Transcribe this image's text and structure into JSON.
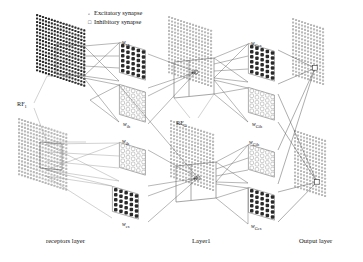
{
  "figure": {
    "type": "neural-network-architecture-diagram",
    "background": "#ffffff",
    "width": 363,
    "height": 262
  },
  "legend": {
    "items": [
      {
        "marker": "circle-open-icon",
        "glyph": "°",
        "label": "Excitatory synapse"
      },
      {
        "marker": "square-open-icon",
        "glyph": "¤",
        "label": "Inhibitory synapse"
      }
    ]
  },
  "layers": [
    {
      "id": "receptors",
      "caption": "receptors layer",
      "x": 46,
      "y": 238
    },
    {
      "id": "layer1",
      "caption": "Layer1",
      "x": 192,
      "y": 238
    },
    {
      "id": "output",
      "caption": "Output layer",
      "x": 299,
      "y": 238
    }
  ],
  "receptive_fields": [
    {
      "id": "rf1",
      "label": "RF",
      "sub": "1",
      "x": 17,
      "y": 101
    },
    {
      "id": "rfg",
      "label": "RF",
      "sub": "G",
      "x": 176,
      "y": 120
    }
  ],
  "weights": [
    {
      "id": "w-ex-top",
      "label": "w",
      "sub": "ex",
      "x": 122,
      "y": 40,
      "kind": "excitatory"
    },
    {
      "id": "w-ih-top",
      "label": "w",
      "sub": "ih",
      "x": 123,
      "y": 122,
      "kind": "inhibitory"
    },
    {
      "id": "w-ih-bot",
      "label": "w",
      "sub": "ih",
      "x": 122,
      "y": 139,
      "kind": "inhibitory"
    },
    {
      "id": "w-ex-bot",
      "label": "w",
      "sub": "ex",
      "x": 122,
      "y": 222,
      "kind": "excitatory"
    },
    {
      "id": "w-gex-top",
      "label": "w",
      "sub": "Gex",
      "x": 251,
      "y": 41,
      "kind": "excitatory"
    },
    {
      "id": "w-gih-top",
      "label": "w",
      "sub": "Gih",
      "x": 252,
      "y": 122,
      "kind": "inhibitory"
    },
    {
      "id": "w-gih-bot",
      "label": "w",
      "sub": "Gih",
      "x": 249,
      "y": 140,
      "kind": "inhibitory"
    },
    {
      "id": "w-gex-bot",
      "label": "w",
      "sub": "Gex",
      "x": 251,
      "y": 224,
      "kind": "excitatory"
    }
  ],
  "colors": {
    "dark_cell": "#2b2b2b",
    "light_cell": "#b9b9b9",
    "mid_cell": "#8c8c8c",
    "line": "#7a7a7a",
    "line_dark": "#4a4a4a",
    "text": "#111111",
    "white": "#ffffff"
  },
  "planes": {
    "receptor_top": {
      "cols": 17,
      "rows": 17,
      "shade": "dark"
    },
    "receptor_bottom": {
      "cols": 17,
      "rows": 17,
      "shade": "light"
    },
    "layer1_top": {
      "cols": 15,
      "rows": 17,
      "shade": "light"
    },
    "layer1_bottom": {
      "cols": 15,
      "rows": 17,
      "shade": "light"
    },
    "output": {
      "cols": 11,
      "rows": 17,
      "shade": "light"
    }
  },
  "weight_panels": [
    {
      "id": "w-ex-top-panel",
      "cols": 5,
      "rows": 6,
      "shade": "dark"
    },
    {
      "id": "w-ih-top-panel",
      "cols": 5,
      "rows": 6,
      "shade": "white"
    },
    {
      "id": "w-ih-bot-panel",
      "cols": 5,
      "rows": 5,
      "shade": "white"
    },
    {
      "id": "w-ex-bot-panel",
      "cols": 5,
      "rows": 5,
      "shade": "dark"
    },
    {
      "id": "w-gex-top-panel",
      "cols": 5,
      "rows": 6,
      "shade": "dark"
    },
    {
      "id": "w-gih-top-panel",
      "cols": 5,
      "rows": 5,
      "shade": "white"
    },
    {
      "id": "w-gih-bot-panel",
      "cols": 5,
      "rows": 5,
      "shade": "white"
    },
    {
      "id": "w-gex-bot-panel",
      "cols": 5,
      "rows": 5,
      "shade": "dark"
    }
  ],
  "nodes": [
    {
      "id": "layer1-neuron-top",
      "marker": "circle-icon",
      "x": 196,
      "y": 72
    },
    {
      "id": "layer1-neuron-bot",
      "marker": "circle-icon",
      "x": 198,
      "y": 178
    },
    {
      "id": "output-neuron-top",
      "marker": "square-icon",
      "x": 315,
      "y": 68
    },
    {
      "id": "output-neuron-bot",
      "marker": "square-icon",
      "x": 317,
      "y": 182
    }
  ]
}
